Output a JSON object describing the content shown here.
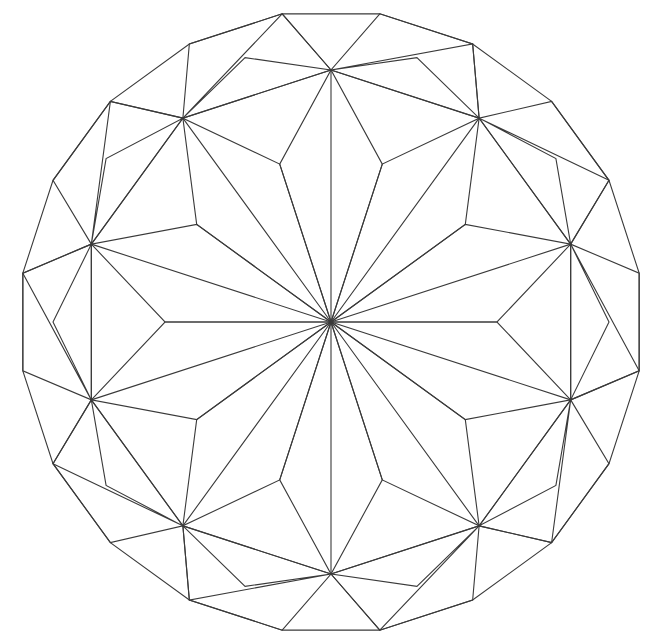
{
  "document": {
    "title": "Decagonal Star Geometric Pattern",
    "kind": "line-diagram",
    "background_color": "#ffffff",
    "stroke_color": "#3a3a3a",
    "stroke_width": 1.1
  },
  "canvas": {
    "width": 664,
    "height": 643
  },
  "chart_data": {
    "type": "diagram",
    "title": "Decagonal Star Geometric Pattern",
    "subtitle": "",
    "center": {
      "x": 331,
      "y": 322
    },
    "rings": [
      {
        "name": "outer-icosagon",
        "sides": 20,
        "circumradius": 312,
        "rotation_deg": 99,
        "role": "outer boundary"
      },
      {
        "name": "rhombus-band-inner-decagon",
        "sides": 10,
        "circumradius": 252,
        "rotation_deg": 90,
        "role": "inner decagon of the rhombus band"
      },
      {
        "name": "star-kite-midring",
        "sides": 10,
        "circumradius": 166,
        "rotation_deg": 90,
        "role": "kite shoulder ring of the ten-pointed star"
      }
    ],
    "star": {
      "points": 10,
      "outer_radius": 252,
      "inner_radius": 166,
      "spoke_count": 10,
      "converges_at_center": true
    },
    "rhombus_band": {
      "count": 20,
      "shape": "rhombus",
      "arrangement": "alternating interlaced band between outer icosagon and inner decagon"
    },
    "bounds": {
      "left_vertex_x": 22,
      "right_vertex_x": 640,
      "top_edge_y": 20,
      "bottom_edge_y": 621
    },
    "legend": [],
    "annotations": [],
    "axis_labels": {
      "x": "",
      "y": ""
    },
    "grid": false
  }
}
